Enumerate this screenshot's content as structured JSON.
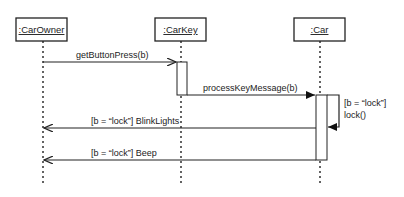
{
  "diagram": {
    "type": "uml-sequence",
    "objects": [
      {
        "id": "owner",
        "label": ":CarOwner"
      },
      {
        "id": "key",
        "label": ":CarKey"
      },
      {
        "id": "car",
        "label": ":Car"
      }
    ],
    "messages": [
      {
        "from": "owner",
        "to": "key",
        "label": "getButtonPress(b)",
        "kind": "call"
      },
      {
        "from": "key",
        "to": "car",
        "label": "processKeyMessage(b)",
        "kind": "call"
      },
      {
        "from": "car",
        "to": "car",
        "label_line1": "[b = “lock”]",
        "label_line2": "lock()",
        "kind": "self-call"
      },
      {
        "from": "car",
        "to": "owner",
        "label": "[b = “lock”] BlinkLights",
        "kind": "call"
      },
      {
        "from": "car",
        "to": "owner",
        "label": "[b = “lock”] Beep",
        "kind": "call"
      }
    ]
  }
}
